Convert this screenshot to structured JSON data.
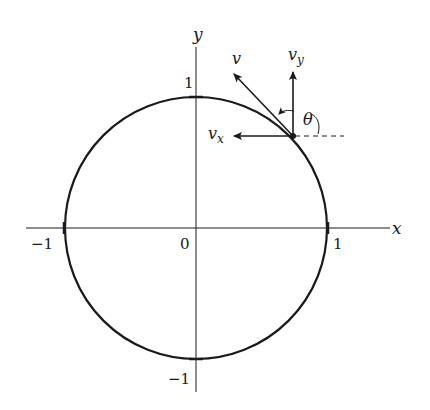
{
  "figure": {
    "axes": {
      "x_label": "x",
      "y_label": "y",
      "origin_label": "0",
      "x_ticks": [
        {
          "value": -1,
          "label": "−1"
        },
        {
          "value": 1,
          "label": "1"
        }
      ],
      "y_ticks": [
        {
          "value": 1,
          "label": "1"
        },
        {
          "value": -1,
          "label": "−1"
        }
      ]
    },
    "circle": {
      "description": "unit circle",
      "radius": 1,
      "center": [
        0,
        0
      ]
    },
    "point": {
      "description": "point on circle where velocity is decomposed",
      "approx_angle_deg": 62
    },
    "vectors": {
      "v": {
        "label": "v",
        "subscript": ""
      },
      "v_x": {
        "label": "v",
        "subscript": "x"
      },
      "v_y": {
        "label": "v",
        "subscript": "y"
      }
    },
    "angle": {
      "label": "θ",
      "description": "angle between velocity v and the positive x direction"
    },
    "colors": {
      "ink": "#1a1a1a",
      "background": "#ffffff"
    }
  }
}
